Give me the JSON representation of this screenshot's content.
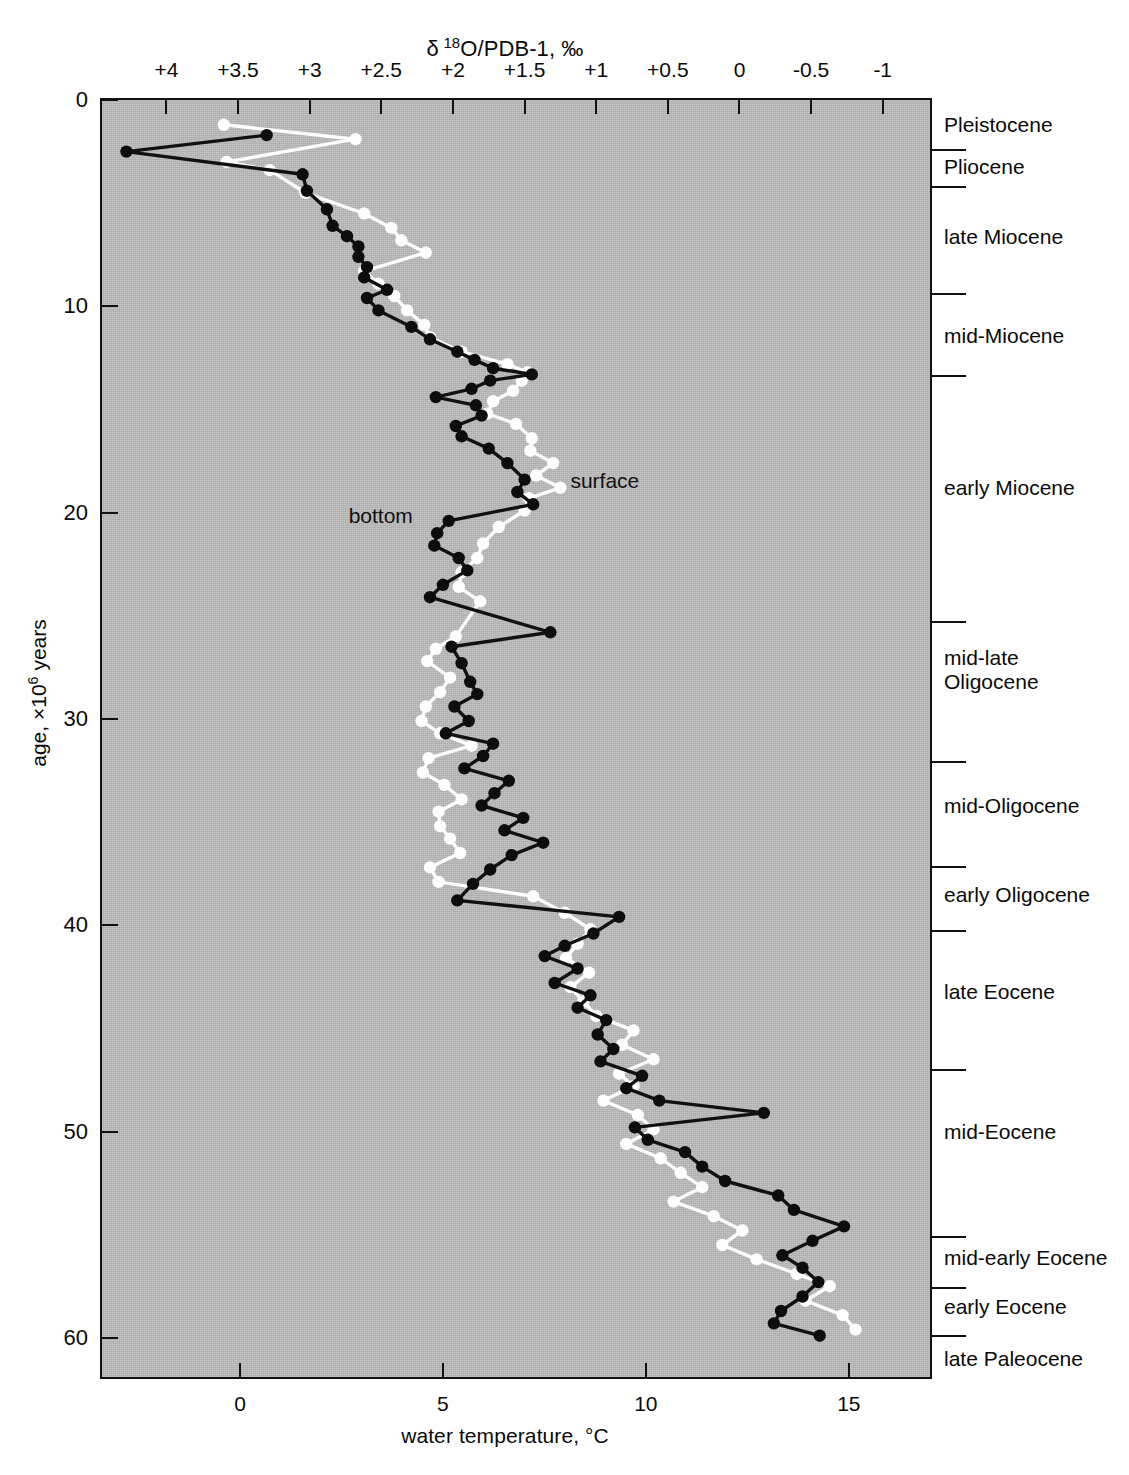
{
  "chart_data": {
    "type": "line",
    "top_axis_label": "δ 18O/PDB-1, ‰",
    "bottom_axis_label": "water temperature, °C",
    "y_axis_label": "age, ×10⁶ years",
    "orientation": "vertical-age-axis",
    "grid": false,
    "legend_position": "inline-annotations",
    "top_axis": {
      "name": "delta-18O-PDB-1-permil",
      "ticks": [
        "+4",
        "+3.5",
        "+3",
        "+2.5",
        "+2",
        "+1.5",
        "+1",
        "+0.5",
        "0",
        "-0.5",
        "-1"
      ],
      "values": [
        4,
        3.5,
        3,
        2.5,
        2,
        1.5,
        1,
        0.5,
        0,
        -0.5,
        -1
      ],
      "range": [
        4.45,
        -1.33
      ],
      "direction": "decreasing-rightward"
    },
    "bottom_axis": {
      "name": "water-temperature-celsius",
      "ticks": [
        "0",
        "5",
        "10",
        "15"
      ],
      "values": [
        0,
        5,
        10,
        15
      ],
      "range": [
        -3.4,
        17.0
      ],
      "unit": "°C"
    },
    "y_axis": {
      "name": "age-million-years",
      "ticks": [
        "0",
        "10",
        "20",
        "30",
        "40",
        "50",
        "60"
      ],
      "values": [
        0,
        10,
        20,
        30,
        40,
        50,
        60
      ],
      "range": [
        0,
        61.9
      ],
      "unit": "×10^6 years",
      "direction": "increasing-downward"
    },
    "epochs": [
      {
        "label": "Pleistocene",
        "top_age": 0.0,
        "bottom_age": 2.4,
        "label_age": 1.2
      },
      {
        "label": "Pliocene",
        "top_age": 2.4,
        "bottom_age": 4.2,
        "label_age": 3.2
      },
      {
        "label": "late Miocene",
        "top_age": 4.2,
        "bottom_age": 9.4,
        "label_age": 6.6
      },
      {
        "label": "mid-Miocene",
        "top_age": 9.4,
        "bottom_age": 13.4,
        "label_age": 11.4
      },
      {
        "label": "early Miocene",
        "top_age": 13.4,
        "bottom_age": 25.3,
        "label_age": 18.8
      },
      {
        "label": "mid-late\nOligocene",
        "top_age": 25.3,
        "bottom_age": 32.1,
        "label_age": 27.6
      },
      {
        "label": "mid-Oligocene",
        "top_age": 32.1,
        "bottom_age": 37.2,
        "label_age": 34.2
      },
      {
        "label": "early Oligocene",
        "top_age": 37.2,
        "bottom_age": 40.3,
        "label_age": 38.5
      },
      {
        "label": "late  Eocene",
        "top_age": 40.3,
        "bottom_age": 47.0,
        "label_age": 43.2
      },
      {
        "label": "mid-Eocene",
        "top_age": 47.0,
        "bottom_age": 55.1,
        "label_age": 50.0
      },
      {
        "label": "mid-early Eocene",
        "top_age": 55.1,
        "bottom_age": 57.6,
        "label_age": 56.1
      },
      {
        "label": "early Eocene",
        "top_age": 57.6,
        "bottom_age": 59.9,
        "label_age": 58.5
      },
      {
        "label": "late Paleocene",
        "top_age": 59.9,
        "bottom_age": 61.9,
        "label_age": 61.0
      }
    ],
    "annotations": [
      {
        "text": "surface",
        "age": 18.5,
        "delta": 1.18
      },
      {
        "text": "bottom",
        "age": 20.2,
        "delta": 2.28
      }
    ],
    "series": [
      {
        "name": "bottom",
        "marker": "filled-circle",
        "color": "#0d0d0d",
        "points": [
          [
            1.7,
            3.3
          ],
          [
            2.5,
            4.28
          ],
          [
            3.6,
            3.05
          ],
          [
            4.4,
            3.02
          ],
          [
            5.3,
            2.88
          ],
          [
            6.1,
            2.84
          ],
          [
            6.6,
            2.74
          ],
          [
            7.1,
            2.66
          ],
          [
            7.6,
            2.66
          ],
          [
            8.1,
            2.6
          ],
          [
            8.6,
            2.62
          ],
          [
            9.2,
            2.46
          ],
          [
            9.6,
            2.6
          ],
          [
            10.2,
            2.52
          ],
          [
            11.0,
            2.29
          ],
          [
            11.6,
            2.16
          ],
          [
            12.2,
            1.97
          ],
          [
            12.6,
            1.85
          ],
          [
            13.0,
            1.72
          ],
          [
            13.3,
            1.45
          ],
          [
            13.6,
            1.74
          ],
          [
            14.0,
            1.87
          ],
          [
            14.4,
            2.12
          ],
          [
            14.8,
            1.84
          ],
          [
            15.3,
            1.8
          ],
          [
            15.8,
            1.98
          ],
          [
            16.3,
            1.94
          ],
          [
            16.9,
            1.75
          ],
          [
            17.6,
            1.62
          ],
          [
            18.4,
            1.5
          ],
          [
            19.0,
            1.55
          ],
          [
            19.6,
            1.44
          ],
          [
            20.4,
            2.03
          ],
          [
            21.0,
            2.11
          ],
          [
            21.6,
            2.13
          ],
          [
            22.2,
            1.96
          ],
          [
            22.8,
            1.9
          ],
          [
            23.5,
            2.07
          ],
          [
            24.1,
            2.16
          ],
          [
            25.8,
            1.32
          ],
          [
            26.5,
            2.01
          ],
          [
            27.3,
            1.94
          ],
          [
            28.2,
            1.88
          ],
          [
            28.8,
            1.83
          ],
          [
            29.4,
            1.99
          ],
          [
            30.1,
            1.89
          ],
          [
            30.7,
            2.05
          ],
          [
            31.2,
            1.72
          ],
          [
            31.8,
            1.79
          ],
          [
            32.4,
            1.92
          ],
          [
            33.0,
            1.61
          ],
          [
            33.6,
            1.71
          ],
          [
            34.2,
            1.8
          ],
          [
            34.8,
            1.51
          ],
          [
            35.4,
            1.64
          ],
          [
            36.0,
            1.37
          ],
          [
            36.6,
            1.59
          ],
          [
            37.3,
            1.74
          ],
          [
            38.0,
            1.86
          ],
          [
            38.8,
            1.97
          ],
          [
            39.6,
            0.84
          ],
          [
            40.4,
            1.02
          ],
          [
            41.0,
            1.22
          ],
          [
            41.5,
            1.36
          ],
          [
            42.1,
            1.13
          ],
          [
            42.8,
            1.29
          ],
          [
            43.4,
            1.04
          ],
          [
            44.0,
            1.13
          ],
          [
            44.6,
            0.93
          ],
          [
            45.3,
            0.99
          ],
          [
            46.0,
            0.88
          ],
          [
            46.6,
            0.97
          ],
          [
            47.3,
            0.68
          ],
          [
            47.9,
            0.79
          ],
          [
            48.5,
            0.56
          ],
          [
            49.1,
            -0.17
          ],
          [
            49.8,
            0.73
          ],
          [
            50.4,
            0.64
          ],
          [
            51.0,
            0.38
          ],
          [
            51.7,
            0.26
          ],
          [
            52.4,
            0.1
          ],
          [
            53.1,
            -0.27
          ],
          [
            53.8,
            -0.38
          ],
          [
            54.6,
            -0.73
          ],
          [
            55.3,
            -0.51
          ],
          [
            56.0,
            -0.3
          ],
          [
            56.6,
            -0.44
          ],
          [
            57.3,
            -0.55
          ],
          [
            58.0,
            -0.44
          ],
          [
            58.7,
            -0.29
          ],
          [
            59.3,
            -0.24
          ],
          [
            59.9,
            -0.56
          ]
        ]
      },
      {
        "name": "surface",
        "marker": "open-circle",
        "color": "#fdfdfd",
        "points": [
          [
            1.2,
            3.6
          ],
          [
            1.9,
            2.68
          ],
          [
            3.0,
            3.58
          ],
          [
            3.4,
            3.28
          ],
          [
            4.5,
            3.03
          ],
          [
            5.5,
            2.62
          ],
          [
            6.2,
            2.43
          ],
          [
            6.8,
            2.36
          ],
          [
            7.4,
            2.19
          ],
          [
            8.3,
            2.62
          ],
          [
            8.9,
            2.52
          ],
          [
            9.5,
            2.41
          ],
          [
            10.2,
            2.32
          ],
          [
            10.9,
            2.2
          ],
          [
            11.5,
            2.16
          ],
          [
            12.2,
            1.94
          ],
          [
            12.8,
            1.62
          ],
          [
            13.2,
            1.48
          ],
          [
            13.6,
            1.52
          ],
          [
            14.1,
            1.58
          ],
          [
            14.6,
            1.72
          ],
          [
            15.2,
            1.76
          ],
          [
            15.7,
            1.56
          ],
          [
            16.4,
            1.45
          ],
          [
            17.0,
            1.46
          ],
          [
            17.6,
            1.3
          ],
          [
            18.2,
            1.42
          ],
          [
            18.8,
            1.25
          ],
          [
            19.3,
            1.47
          ],
          [
            19.9,
            1.5
          ],
          [
            20.7,
            1.68
          ],
          [
            21.5,
            1.79
          ],
          [
            22.2,
            1.83
          ],
          [
            22.9,
            1.94
          ],
          [
            23.6,
            1.96
          ],
          [
            24.3,
            1.81
          ],
          [
            26.0,
            1.98
          ],
          [
            26.6,
            2.12
          ],
          [
            27.2,
            2.18
          ],
          [
            28.0,
            2.02
          ],
          [
            28.7,
            2.09
          ],
          [
            29.4,
            2.19
          ],
          [
            30.1,
            2.22
          ],
          [
            30.7,
            2.09
          ],
          [
            31.3,
            1.87
          ],
          [
            31.9,
            2.17
          ],
          [
            32.6,
            2.21
          ],
          [
            33.2,
            2.06
          ],
          [
            33.9,
            1.94
          ],
          [
            34.5,
            2.1
          ],
          [
            35.2,
            2.09
          ],
          [
            35.8,
            2.02
          ],
          [
            36.5,
            1.95
          ],
          [
            37.2,
            2.16
          ],
          [
            37.9,
            2.1
          ],
          [
            38.6,
            1.44
          ],
          [
            39.4,
            1.22
          ],
          [
            40.2,
            1.04
          ],
          [
            40.9,
            1.13
          ],
          [
            41.6,
            1.21
          ],
          [
            42.3,
            1.05
          ],
          [
            43.0,
            1.18
          ],
          [
            43.7,
            1.09
          ],
          [
            44.4,
            1.0
          ],
          [
            45.1,
            0.74
          ],
          [
            45.8,
            0.82
          ],
          [
            46.5,
            0.6
          ],
          [
            47.2,
            0.84
          ],
          [
            47.8,
            0.74
          ],
          [
            48.5,
            0.95
          ],
          [
            49.2,
            0.71
          ],
          [
            49.9,
            0.6
          ],
          [
            50.6,
            0.79
          ],
          [
            51.3,
            0.55
          ],
          [
            52.0,
            0.41
          ],
          [
            52.7,
            0.26
          ],
          [
            53.4,
            0.46
          ],
          [
            54.1,
            0.18
          ],
          [
            54.8,
            -0.02
          ],
          [
            55.5,
            0.12
          ],
          [
            56.2,
            -0.12
          ],
          [
            56.9,
            -0.4
          ],
          [
            57.5,
            -0.63
          ],
          [
            58.2,
            -0.46
          ],
          [
            58.9,
            -0.72
          ],
          [
            59.6,
            -0.81
          ]
        ]
      }
    ]
  },
  "colors": {
    "plot_background": "#b6b6b6",
    "frame": "#111111",
    "bottom_series": "#0d0d0d",
    "surface_series": "#fdfdfd"
  }
}
